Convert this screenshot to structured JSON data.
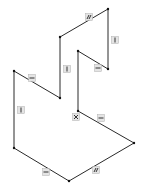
{
  "diagram": {
    "type": "isometric-sketch",
    "background": "#ffffff",
    "line_color": "#2a2a2a",
    "vertices": [
      {
        "id": "A",
        "x": 108,
        "y": 9
      },
      {
        "id": "B",
        "x": 60,
        "y": 37
      },
      {
        "id": "C",
        "x": 60,
        "y": 98
      },
      {
        "id": "D",
        "x": 14,
        "y": 71
      },
      {
        "id": "E",
        "x": 14,
        "y": 148
      },
      {
        "id": "F",
        "x": 69,
        "y": 181
      },
      {
        "id": "G",
        "x": 134,
        "y": 143
      },
      {
        "id": "H",
        "x": 78,
        "y": 111
      },
      {
        "id": "I",
        "x": 78,
        "y": 51
      },
      {
        "id": "J",
        "x": 108,
        "y": 69
      }
    ],
    "edges": [
      {
        "from": "A",
        "to": "B",
        "constraint": "parallel-icon"
      },
      {
        "from": "B",
        "to": "C",
        "constraint": "vertical-icon"
      },
      {
        "from": "C",
        "to": "D",
        "constraint": "horizontal-icon"
      },
      {
        "from": "D",
        "to": "E",
        "constraint": "vertical-icon"
      },
      {
        "from": "E",
        "to": "F",
        "constraint": "horizontal-icon"
      },
      {
        "from": "F",
        "to": "G",
        "constraint": "parallel-icon"
      },
      {
        "from": "G",
        "to": "H",
        "constraint": "horizontal-icon"
      },
      {
        "from": "H",
        "to": "I",
        "constraint": "coincident-icon"
      },
      {
        "from": "I",
        "to": "J",
        "constraint": "horizontal-icon"
      },
      {
        "from": "J",
        "to": "A",
        "constraint": "vertical-icon"
      }
    ],
    "glyphs": [
      {
        "name": "parallel-icon",
        "x": 89,
        "y": 17,
        "kind": "parallel"
      },
      {
        "name": "vertical-icon",
        "x": 115,
        "y": 40,
        "kind": "vertical"
      },
      {
        "name": "horizontal-icon",
        "x": 98,
        "y": 68,
        "kind": "horizontal"
      },
      {
        "name": "vertical-icon",
        "x": 67,
        "y": 69,
        "kind": "vertical"
      },
      {
        "name": "horizontal-icon",
        "x": 32,
        "y": 78,
        "kind": "horizontal"
      },
      {
        "name": "vertical-icon",
        "x": 21,
        "y": 110,
        "kind": "vertical"
      },
      {
        "name": "coincident-icon",
        "x": 76,
        "y": 117,
        "kind": "coincident"
      },
      {
        "name": "horizontal-icon",
        "x": 101,
        "y": 118,
        "kind": "horizontal"
      },
      {
        "name": "horizontal-icon",
        "x": 46,
        "y": 172,
        "kind": "horizontal"
      },
      {
        "name": "parallel-icon",
        "x": 96,
        "y": 170,
        "kind": "parallel"
      }
    ]
  }
}
